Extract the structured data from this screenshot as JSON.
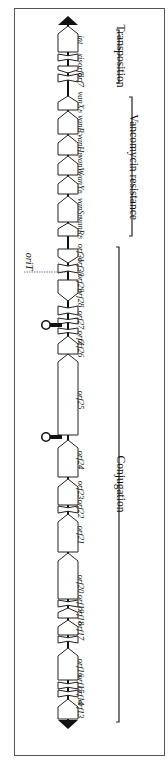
{
  "figure": {
    "orientation": "rotated-90",
    "frame_color": "#555555",
    "gene_fill": "#ffffff",
    "gene_stroke": "#222222"
  },
  "genes": [
    {
      "label": "int",
      "y1": 26,
      "y2": 52,
      "dir": "up"
    },
    {
      "label": "xis",
      "y1": 54,
      "y2": 61,
      "dir": "none"
    },
    {
      "label": "orf8",
      "y1": 66,
      "y2": 73,
      "dir": "down"
    },
    {
      "label": "orf7",
      "y1": 74,
      "y2": 82,
      "dir": "none"
    },
    {
      "label": "vanXB",
      "y1": 96,
      "y2": 110,
      "dir": "up"
    },
    {
      "label": "vanB",
      "y1": 111,
      "y2": 134,
      "dir": "up"
    },
    {
      "label": "vanHB",
      "y1": 135,
      "y2": 155,
      "dir": "up"
    },
    {
      "label": "vanW",
      "y1": 156,
      "y2": 175,
      "dir": "up"
    },
    {
      "label": "vanYB",
      "y1": 176,
      "y2": 194,
      "dir": "up"
    },
    {
      "label": "vanSB",
      "y1": 196,
      "y2": 222,
      "dir": "up"
    },
    {
      "label": "vanRB",
      "y1": 223,
      "y2": 236,
      "dir": "up"
    },
    {
      "label": "orf31",
      "y1": 249,
      "y2": 263,
      "dir": "down"
    },
    {
      "label": "orf30",
      "y1": 264,
      "y2": 273,
      "dir": "none"
    },
    {
      "label": "orf29",
      "y1": 280,
      "y2": 301,
      "dir": "down"
    },
    {
      "label": "orf28",
      "y1": 306,
      "y2": 315,
      "dir": "none"
    },
    {
      "label": "orf27",
      "y1": 318,
      "y2": 324,
      "dir": "none"
    },
    {
      "label": "orfZ",
      "y1": 328,
      "y2": 334,
      "dir": "none"
    },
    {
      "label": "orf26",
      "y1": 336,
      "y2": 354,
      "dir": "up"
    },
    {
      "label": "orf25",
      "y1": 354,
      "y2": 435,
      "dir": "up"
    },
    {
      "label": "orf24",
      "y1": 440,
      "y2": 477,
      "dir": "up"
    },
    {
      "label": "orf23",
      "y1": 479,
      "y2": 505,
      "dir": "up"
    },
    {
      "label": "orf22",
      "y1": 506,
      "y2": 513,
      "dir": "none"
    },
    {
      "label": "orf21",
      "y1": 514,
      "y2": 552,
      "dir": "up"
    },
    {
      "label": "orf20",
      "y1": 553,
      "y2": 599,
      "dir": "up"
    },
    {
      "label": "orf19",
      "y1": 600,
      "y2": 607,
      "dir": "none"
    },
    {
      "label": "orf18",
      "y1": 608,
      "y2": 618,
      "dir": "up"
    },
    {
      "label": "orf17",
      "y1": 620,
      "y2": 635,
      "dir": "up"
    },
    {
      "label": "orf17b",
      "y1": 636,
      "y2": 643,
      "dir": "none"
    },
    {
      "label": "orf16",
      "y1": 648,
      "y2": 680,
      "dir": "up"
    },
    {
      "label": "orf15",
      "y1": 682,
      "y2": 689,
      "dir": "none"
    },
    {
      "label": "orf14",
      "y1": 690,
      "y2": 697,
      "dir": "none"
    },
    {
      "label": "orf13",
      "y1": 699,
      "y2": 719,
      "dir": "up"
    }
  ],
  "gene_labels": [
    {
      "text": "int",
      "sub": "",
      "y": 40
    },
    {
      "text": "xis",
      "sub": "",
      "y": 58
    },
    {
      "text": "orf8",
      "sub": "",
      "y": 70
    },
    {
      "text": "orf7",
      "sub": "",
      "y": 80
    },
    {
      "text": "vanX",
      "sub": "B",
      "y": 102
    },
    {
      "text": "vanB",
      "sub": "",
      "y": 124
    },
    {
      "text": "vanH",
      "sub": "B",
      "y": 145
    },
    {
      "text": "vanW",
      "sub": "",
      "y": 165
    },
    {
      "text": "vanY",
      "sub": "B",
      "y": 183
    },
    {
      "text": "vanS",
      "sub": "B",
      "y": 208
    },
    {
      "text": "vanR",
      "sub": "B",
      "y": 228
    },
    {
      "text": "orf31",
      "sub": "",
      "y": 253
    },
    {
      "text": "orf30",
      "sub": "",
      "y": 267
    },
    {
      "text": "orf29",
      "sub": "",
      "y": 283
    },
    {
      "text": "orf28",
      "sub": "",
      "y": 298
    },
    {
      "text": "orf27",
      "sub": "",
      "y": 320
    },
    {
      "text": "orfZ",
      "sub": "",
      "y": 338
    },
    {
      "text": "orf26",
      "sub": "",
      "y": 348
    },
    {
      "text": "orf25",
      "sub": "",
      "y": 400
    },
    {
      "text": "orf24",
      "sub": "",
      "y": 460
    },
    {
      "text": "orf23",
      "sub": "",
      "y": 490
    },
    {
      "text": "orf22",
      "sub": "",
      "y": 509
    },
    {
      "text": "orf21",
      "sub": "",
      "y": 535
    },
    {
      "text": "orf20",
      "sub": "",
      "y": 584
    },
    {
      "text": "orf19",
      "sub": "",
      "y": 604
    },
    {
      "text": "orf18",
      "sub": "",
      "y": 616
    },
    {
      "text": "orf17",
      "sub": "",
      "y": 631
    },
    {
      "text": "orf16",
      "sub": "",
      "y": 668
    },
    {
      "text": "orf15",
      "sub": "",
      "y": 684
    },
    {
      "text": "orf14",
      "sub": "",
      "y": 696
    },
    {
      "text": "orf13",
      "sub": "",
      "y": 709
    }
  ],
  "stem_loops": [
    {
      "y": 325
    },
    {
      "y": 437
    }
  ],
  "origin": {
    "label": "oriT",
    "y": 272
  },
  "regions": [
    {
      "label": "Transposition",
      "y1": 30,
      "y2": 83,
      "label_y": 56
    },
    {
      "label": "Vancomycin resistance",
      "y1": 97,
      "y2": 236,
      "label_y": 167
    },
    {
      "label": "Conjugation",
      "y1": 247,
      "y2": 722,
      "label_y": 484
    }
  ]
}
